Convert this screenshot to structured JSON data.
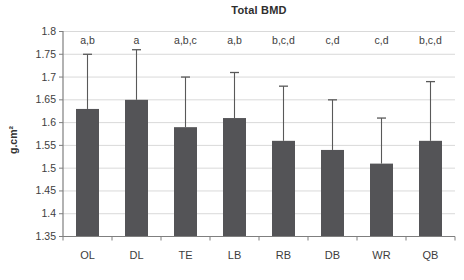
{
  "chart_data": {
    "type": "bar",
    "title": "Total BMD",
    "ylabel": "g.cm²",
    "xlabel": "",
    "categories": [
      "OL",
      "DL",
      "TE",
      "LB",
      "RB",
      "DB",
      "WR",
      "QB"
    ],
    "values": [
      1.63,
      1.65,
      1.59,
      1.61,
      1.56,
      1.54,
      1.51,
      1.56
    ],
    "error_top": [
      1.75,
      1.76,
      1.7,
      1.71,
      1.68,
      1.65,
      1.61,
      1.69
    ],
    "sig_labels": [
      "a,b",
      "a",
      "a,b,c",
      "a,b",
      "b,c,d",
      "c,d",
      "c,d",
      "b,c,d"
    ],
    "ylim": [
      1.35,
      1.8
    ],
    "ytick_step": 0.05,
    "grid": true,
    "legend": "none",
    "colors": {
      "bar": "#545457",
      "error_bar": "#595959",
      "gridline": "#d9d9d9",
      "axis": "#7f7f7f",
      "text": "#3d3d3d",
      "title_text": "#2e2e2e",
      "background": "#ffffff"
    }
  }
}
